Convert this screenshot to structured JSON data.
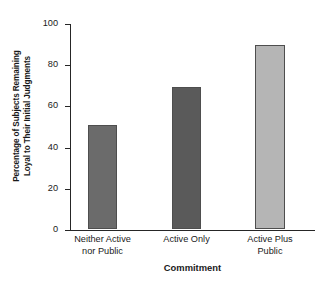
{
  "chart_data": {
    "type": "bar",
    "title": "",
    "subtitle": "",
    "xlabel": "Commitment",
    "ylabel": "Percentage of Subjects Remaining Loyal to Their Initial Judgments",
    "ylabel_lines": [
      "Percentage of Subjects Remaining",
      "Loyal to Their Initial Judgments"
    ],
    "categories": [
      "Neither Active nor Public",
      "Active Only",
      "Active Plus Public"
    ],
    "category_lines": [
      [
        "Neither Active",
        "nor Public"
      ],
      [
        "Active Only",
        ""
      ],
      [
        "Active Plus",
        "Public"
      ]
    ],
    "values": [
      50.5,
      69,
      89.5
    ],
    "ylim": [
      0,
      100
    ],
    "yticks": [
      0,
      20,
      40,
      60,
      80,
      100
    ],
    "ytick_labels": [
      "0",
      "20",
      "40",
      "60",
      "80",
      "100"
    ],
    "grid": false,
    "legend": "none",
    "bar_colors": [
      "#6b6b6b",
      "#5a5a5a",
      "#b5b5b5"
    ],
    "bar_edge_color": "#4e4e4e",
    "axis_color": "#262626"
  }
}
